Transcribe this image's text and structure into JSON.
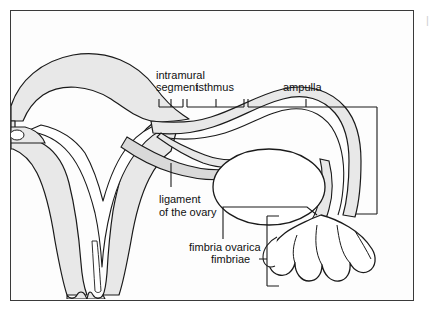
{
  "figure": {
    "background_color": "#fdfdfd",
    "frame_color": "#3a3a3a",
    "tissue_fill": "#e8e8e8",
    "cavity_fill": "#ffffff",
    "line_color": "#1a1a1a",
    "label_color": "#111111"
  },
  "labels": {
    "intramural_line1": "intramural",
    "intramural_line2": "segment",
    "isthmus": "isthmus",
    "ampulla": "ampulla",
    "ligament_line1": "ligament",
    "ligament_line2": "of the ovary",
    "fimbria_ovarica": "fimbria ovarica",
    "fimbriae": "fimbriae"
  },
  "edge_artifact": {
    "text": "|"
  }
}
